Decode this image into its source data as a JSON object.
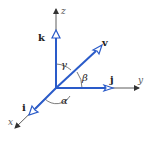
{
  "diagram": {
    "colors": {
      "vector": "#2a5bc9",
      "axis": "#333333",
      "arc": "#444444",
      "text": "#222222"
    },
    "axes": {
      "x_label": "x",
      "y_label": "y",
      "z_label": "z"
    },
    "unit_vectors": {
      "i_label": "i",
      "j_label": "j",
      "k_label": "k"
    },
    "vector": {
      "label": "v"
    },
    "angles": {
      "alpha": "α",
      "beta": "β",
      "gamma": "γ"
    }
  }
}
